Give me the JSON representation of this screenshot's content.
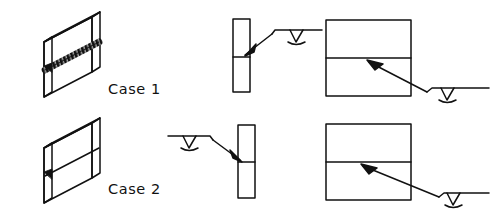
{
  "figure": {
    "type": "technical-line-diagram",
    "background_color": "#ffffff",
    "line_color": "#111111",
    "rows": [
      {
        "id": "case-1",
        "label": "Case 1",
        "weld_appearance": "hatched-thick-weld-bead",
        "probe_side_edge_view": "right",
        "probe_side_section_view": "right-lower"
      },
      {
        "id": "case-2",
        "label": "Case 2",
        "weld_appearance": "thin-plain-line-with-root-triangle",
        "probe_side_edge_view": "left",
        "probe_side_section_view": "right-lower-far"
      }
    ],
    "columns": [
      {
        "id": "isometric-plate",
        "name": "isometric welded plate"
      },
      {
        "id": "edge-view",
        "name": "plate edge view with transducer"
      },
      {
        "id": "section-view",
        "name": "plan section view with transducer"
      }
    ],
    "icons": {
      "transducer": "ultrasonic-transducer-icon",
      "arrow": "beam-direction-arrow-icon",
      "weld_bead": "weld-bead-icon",
      "root_defect": "root-defect-triangle-icon"
    }
  },
  "labels": {
    "case1": "Case 1",
    "case2": "Case 2"
  }
}
